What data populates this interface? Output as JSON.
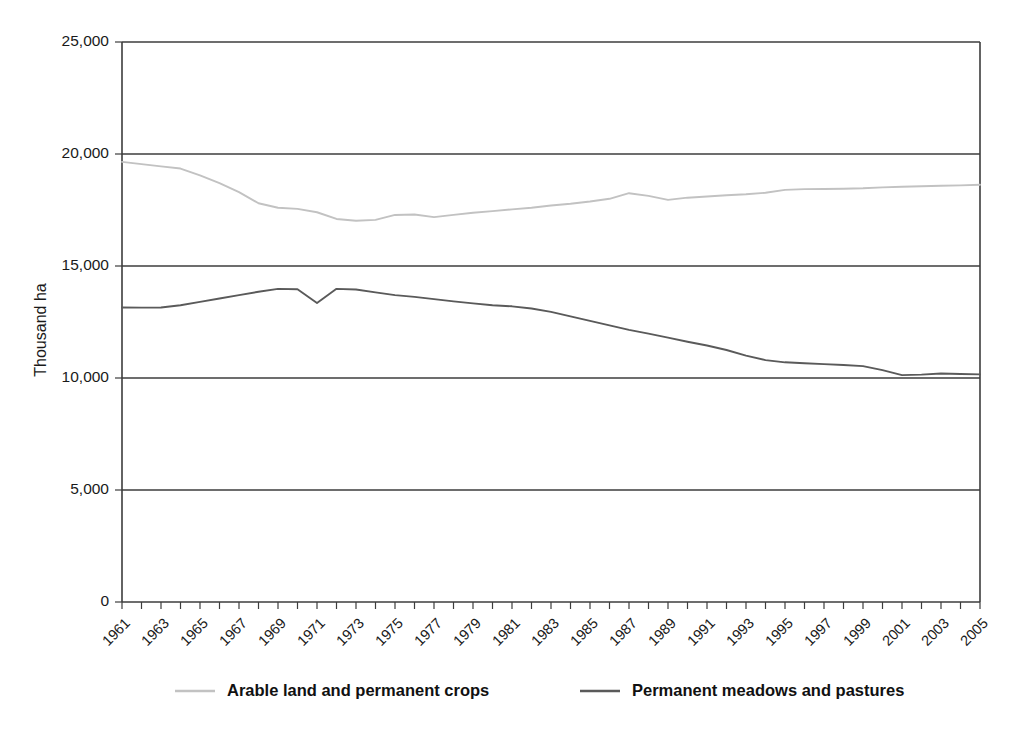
{
  "chart_data": {
    "type": "line",
    "title": "",
    "subtitle": "",
    "xlabel": "",
    "ylabel": "Thousand ha",
    "ylim": [
      0,
      25000
    ],
    "xlim": [
      1961,
      2005
    ],
    "grid": true,
    "legend_position": "bottom",
    "y_ticks": [
      0,
      5000,
      10000,
      15000,
      20000,
      25000
    ],
    "y_tick_labels": [
      "0",
      "5,000",
      "10,000",
      "15,000",
      "20,000",
      "25,000"
    ],
    "x": [
      1961,
      1962,
      1963,
      1964,
      1965,
      1966,
      1967,
      1968,
      1969,
      1970,
      1971,
      1972,
      1973,
      1974,
      1975,
      1976,
      1977,
      1978,
      1979,
      1980,
      1981,
      1982,
      1983,
      1984,
      1985,
      1986,
      1987,
      1988,
      1989,
      1990,
      1991,
      1992,
      1993,
      1994,
      1995,
      1996,
      1997,
      1998,
      1999,
      2000,
      2001,
      2002,
      2003,
      2004,
      2005
    ],
    "x_tick_labels": [
      "1961",
      "1963",
      "1965",
      "1967",
      "1969",
      "1971",
      "1973",
      "1975",
      "1977",
      "1979",
      "1981",
      "1983",
      "1985",
      "1987",
      "1989",
      "1991",
      "1993",
      "1995",
      "1997",
      "1999",
      "2001",
      "2003",
      "2005"
    ],
    "series": [
      {
        "name": "Arable land and permanent crops",
        "color": "#c2c2c2",
        "values": [
          19650,
          19550,
          19450,
          19350,
          19050,
          18700,
          18300,
          17800,
          17600,
          17550,
          17400,
          17100,
          17020,
          17060,
          17280,
          17300,
          17180,
          17280,
          17380,
          17450,
          17530,
          17600,
          17700,
          17780,
          17880,
          18000,
          18250,
          18130,
          17950,
          18050,
          18100,
          18160,
          18200,
          18270,
          18400,
          18430,
          18440,
          18450,
          18470,
          18510,
          18540,
          18560,
          18580,
          18600,
          18630
        ]
      },
      {
        "name": "Permanent meadows and pastures",
        "color": "#5a5a5a",
        "values": [
          13150,
          13140,
          13150,
          13250,
          13400,
          13550,
          13700,
          13850,
          13980,
          13960,
          13350,
          13980,
          13950,
          13820,
          13700,
          13620,
          13520,
          13420,
          13330,
          13250,
          13200,
          13100,
          12950,
          12750,
          12550,
          12350,
          12150,
          11980,
          11800,
          11620,
          11450,
          11250,
          11000,
          10800,
          10700,
          10660,
          10620,
          10580,
          10530,
          10350,
          10130,
          10150,
          10200,
          10180,
          10160
        ]
      }
    ]
  },
  "legend": {
    "items": [
      {
        "label": "Arable land and permanent crops",
        "color": "#c2c2c2"
      },
      {
        "label": "Permanent meadows and pastures",
        "color": "#5a5a5a"
      }
    ]
  },
  "axes": {
    "y_title": "Thousand ha"
  }
}
